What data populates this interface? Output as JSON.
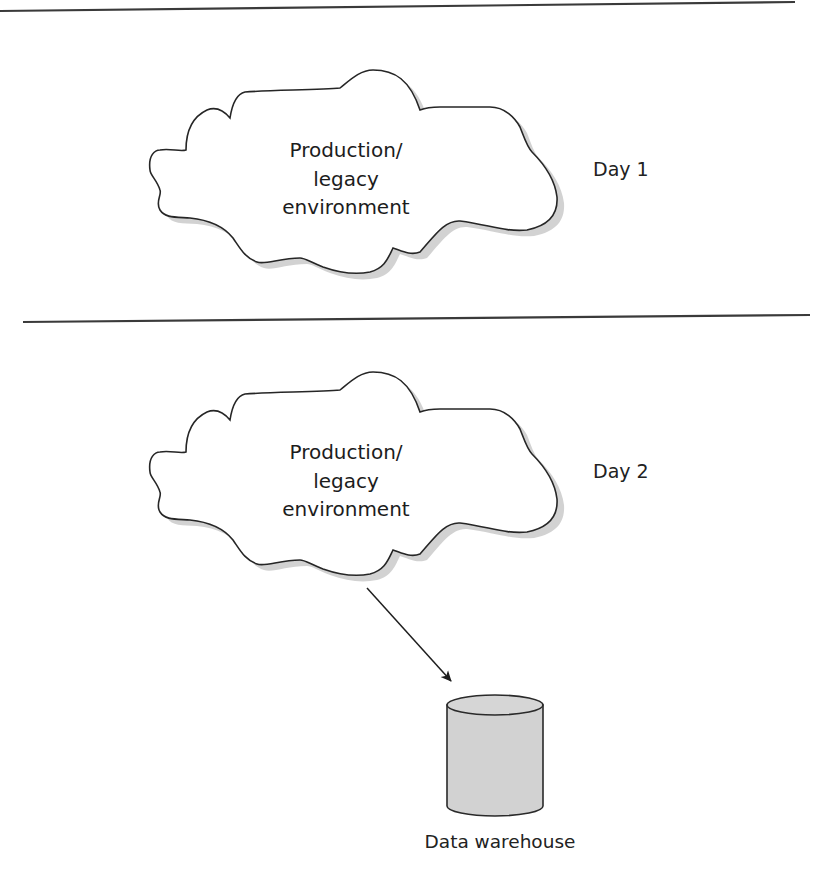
{
  "diagram": {
    "panels": [
      {
        "id": "day1",
        "cloud": {
          "lines": [
            "Production/",
            "legacy",
            "environment"
          ]
        },
        "day_label": "Day 1"
      },
      {
        "id": "day2",
        "cloud": {
          "lines": [
            "Production/",
            "legacy",
            "environment"
          ]
        },
        "day_label": "Day 2",
        "arrow": {
          "from": "Production/legacy environment",
          "to": "Data warehouse"
        },
        "database": {
          "label": "Data warehouse",
          "icon": "cylinder-database-icon"
        }
      }
    ],
    "colors": {
      "line": "#2a2a2a",
      "shadow": "#cfcfcf",
      "database_fill": "#d2d2d2",
      "background": "#ffffff"
    }
  }
}
